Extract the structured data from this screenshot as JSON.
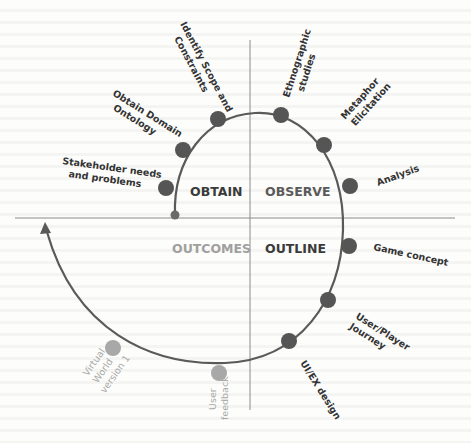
{
  "diagram": {
    "type": "spiral-process",
    "colors": {
      "axis": "#8a8a8a",
      "spiral": "#5a5a5a",
      "dot_dark": "#555555",
      "dot_light": "#a8a8a8",
      "text_dark": "#333333",
      "text_light": "#a9a9a9",
      "quadrant_obtain": "#3a3a3a",
      "quadrant_observe": "#5a5a5a",
      "quadrant_outline": "#3a3a3a",
      "quadrant_outcomes": "#a0a0a0"
    },
    "quadrants": {
      "obtain": "OBTAIN",
      "observe": "OBSERVE",
      "outline": "OUTLINE",
      "outcomes": "OUTCOMES"
    },
    "steps": {
      "stakeholder": [
        "Stakeholder needs",
        "and problems"
      ],
      "ontology": [
        "Obtain Domain",
        "Ontology"
      ],
      "scope": [
        "Identify Scope and",
        "Constraints"
      ],
      "ethnographic": [
        "Ethnographic",
        "studies"
      ],
      "metaphor": [
        "Metaphor",
        "Elicitation"
      ],
      "analysis": [
        "Analysis"
      ],
      "game_concept": [
        "Game concept"
      ],
      "journey": [
        "User/Player",
        "Journey"
      ],
      "uiex": [
        "UI/EX design"
      ],
      "feedback": [
        "User",
        "feedback"
      ],
      "virtual_world": [
        "Virtual",
        "World",
        "version 1"
      ]
    }
  }
}
